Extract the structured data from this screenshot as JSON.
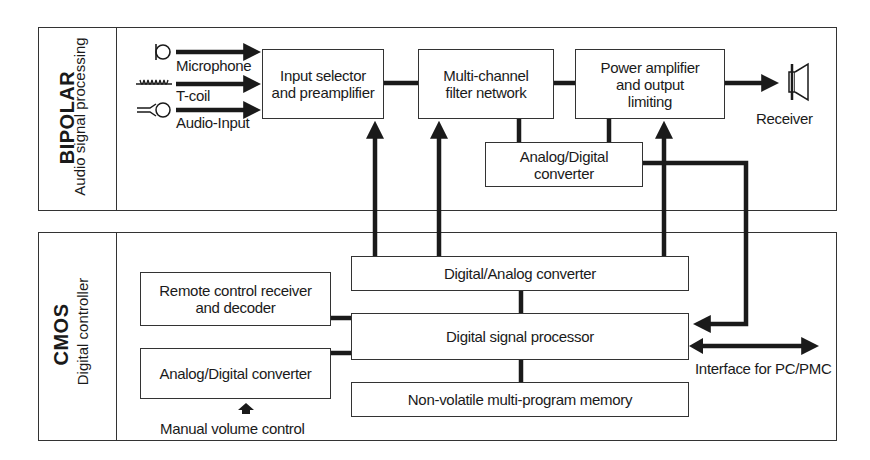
{
  "diagram": {
    "sections": {
      "bipolar": {
        "title": "BIPOLAR",
        "subtitle": "Audio signal processing",
        "inputs": [
          {
            "label": "Microphone",
            "icon": "microphone-icon"
          },
          {
            "label": "T-coil",
            "icon": "t-coil-icon"
          },
          {
            "label": "Audio-Input",
            "icon": "audio-input-jack-icon"
          }
        ],
        "blocks": {
          "input_selector": "Input selector and preamplifier",
          "filter_network": "Multi-channel filter network",
          "power_amp": "Power amplifier and output limiting",
          "adc": "Analog/Digital converter"
        },
        "output": {
          "label": "Receiver",
          "icon": "speaker-receiver-icon"
        }
      },
      "cmos": {
        "title": "CMOS",
        "subtitle": "Digital controller",
        "blocks": {
          "remote": "Remote control receiver and decoder",
          "adc": "Analog/Digital converter",
          "dac": "Digital/Analog converter",
          "dsp": "Digital signal processor",
          "memory": "Non-volatile multi-program memory"
        },
        "manual_volume": "Manual volume control",
        "interface": "Interface for PC/PMC"
      }
    },
    "colors": {
      "line": "#1a1a1a",
      "border": "#333333",
      "background": "#ffffff"
    }
  }
}
